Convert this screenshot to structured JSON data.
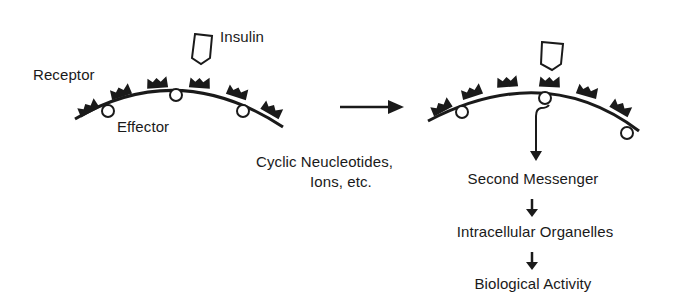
{
  "diagram": {
    "left_panel": {
      "labels": {
        "receptor": "Receptor",
        "effector": "Effector",
        "insulin": "Insulin"
      }
    },
    "transition_arrow": "right-arrow-icon",
    "right_panel": {
      "side_note": {
        "line1": "Cyclic Neucleotides,",
        "line2": "Ions, etc."
      },
      "cascade": [
        "Second Messenger",
        "Intracellular Organelles",
        "Biological Activity"
      ]
    },
    "colors": {
      "ink": "#1a1a1a",
      "background": "#ffffff"
    }
  }
}
